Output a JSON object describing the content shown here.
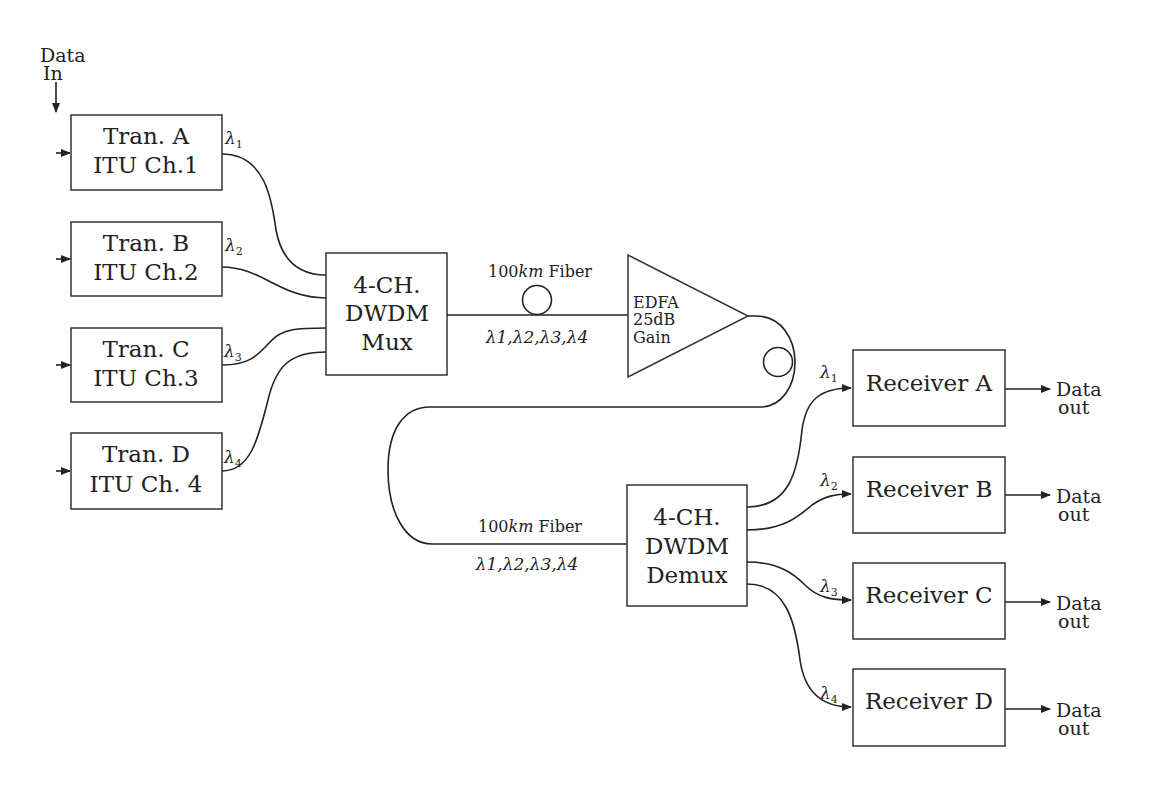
{
  "diagram": {
    "data_in": {
      "line1": "Data",
      "line2": "In"
    },
    "transmitters": [
      {
        "id": "A",
        "line1": "Tran. A",
        "line2": "ITU Ch.1",
        "wavelength": "λ",
        "wavelength_sub": "1"
      },
      {
        "id": "B",
        "line1": "Tran. B",
        "line2": "ITU Ch.2",
        "wavelength": "λ",
        "wavelength_sub": "2"
      },
      {
        "id": "C",
        "line1": "Tran. C",
        "line2": "ITU Ch.3",
        "wavelength": "λ",
        "wavelength_sub": "3"
      },
      {
        "id": "D",
        "line1": "Tran. D",
        "line2": "ITU Ch. 4",
        "wavelength": "λ",
        "wavelength_sub": "4"
      }
    ],
    "mux": {
      "line1": "4-CH.",
      "line2": "DWDM",
      "line3": "Mux"
    },
    "fiber1": {
      "length": "100",
      "unit": "km",
      "label": "Fiber",
      "channels": "λ1,λ2,λ3,λ4"
    },
    "edfa": {
      "line1": "EDFA",
      "line2": "25dB",
      "line3": "Gain"
    },
    "fiber2": {
      "length": "100",
      "unit": "km",
      "label": "Fiber",
      "channels": "λ1,λ2,λ3,λ4"
    },
    "demux": {
      "line1": "4-CH.",
      "line2": "DWDM",
      "line3": "Demux"
    },
    "receivers": [
      {
        "id": "A",
        "label": "Receiver A",
        "wavelength": "λ",
        "wavelength_sub": "1",
        "out1": "Data",
        "out2": "out"
      },
      {
        "id": "B",
        "label": "Receiver B",
        "wavelength": "λ",
        "wavelength_sub": "2",
        "out1": "Data",
        "out2": "out"
      },
      {
        "id": "C",
        "label": "Receiver C",
        "wavelength": "λ",
        "wavelength_sub": "3",
        "out1": "Data",
        "out2": "out"
      },
      {
        "id": "D",
        "label": "Receiver D",
        "wavelength": "λ",
        "wavelength_sub": "4",
        "out1": "Data",
        "out2": "out"
      }
    ],
    "colors": {
      "line": "#222222",
      "background": "#ffffff"
    }
  }
}
